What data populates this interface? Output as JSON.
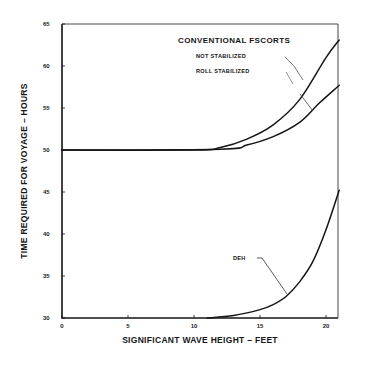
{
  "chart_data": {
    "type": "line",
    "title": "",
    "xlabel": "SIGNIFICANT WAVE HEIGHT – FEET",
    "ylabel": "TIME REQUIRED FOR VOYAGE – HOURS",
    "xlim": [
      0,
      23
    ],
    "ylim": [
      30,
      65
    ],
    "xticks": [
      0,
      5,
      10,
      15,
      20
    ],
    "yticks": [
      30,
      35,
      40,
      45,
      50,
      55,
      60,
      65
    ],
    "grid": false,
    "legend": "annotations",
    "annotations": {
      "group_title": "CONVENTIONAL FSCORTS",
      "not_stabilized": "NOT STABILIZED",
      "roll_stabilized": "ROLL STABILIZED",
      "deh": "DEH"
    },
    "series": [
      {
        "name": "Conventional Escorts - Not Stabilized",
        "x": [
          0,
          10,
          12,
          14,
          16,
          18,
          20,
          21
        ],
        "y": [
          50,
          50,
          50.3,
          51.3,
          53,
          56,
          61,
          63.1
        ]
      },
      {
        "name": "Conventional Escorts - Roll Stabilized",
        "x": [
          0,
          12,
          14,
          16,
          18,
          19.5,
          21
        ],
        "y": [
          50,
          50.1,
          50.6,
          51.6,
          53.3,
          55.6,
          57.7
        ]
      },
      {
        "name": "DEH",
        "x": [
          11,
          13,
          15,
          16,
          17,
          18,
          19,
          20,
          21
        ],
        "y": [
          30,
          30.3,
          31,
          31.6,
          32.6,
          34.3,
          36.7,
          40.5,
          45.2
        ]
      }
    ]
  },
  "colors": {
    "ink": "#151515",
    "background": "#ffffff"
  }
}
